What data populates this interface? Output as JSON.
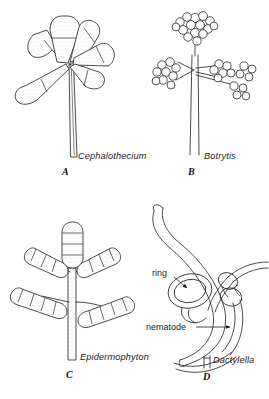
{
  "figure": {
    "background_color": "#ffffff",
    "ink_color": "#2b2b2b",
    "text_color": "#1d1d1d"
  },
  "panels": [
    {
      "id": "A",
      "letter": "A",
      "name": "Cephalothecium",
      "caption": "Cephalothecium",
      "description": "Conidiophore bearing a whorl of elongate two-celled conidia",
      "conidia_count": 6,
      "septa_per_conidium": 1
    },
    {
      "id": "B",
      "letter": "B",
      "name": "Botrytis",
      "caption": "Botrytis",
      "description": "Branched conidiophore with grape-like clusters of globose conidia",
      "cluster_count": 5
    },
    {
      "id": "C",
      "letter": "C",
      "name": "Epidermophyton",
      "caption": "Epidermophyton",
      "description": "Conidiophore with club-shaped multiseptate macroconidia",
      "macroconidia_count": 5,
      "cells_per_macroconidium": 4
    },
    {
      "id": "D",
      "letter": "D",
      "name": "Dactylella",
      "caption": "Dactylella",
      "description": "Nematode-trapping fungus with constricting rings encircling a nematode",
      "annotations": [
        {
          "label": "ring",
          "pointer": "arrow",
          "direction": "down-right"
        },
        {
          "label": "nematode",
          "pointer": "arrow",
          "direction": "right"
        }
      ]
    }
  ],
  "annotations": {
    "ring_label": "ring",
    "nematode_label": "nematode"
  },
  "captions": {
    "a": "Cephalothecium",
    "b": "Botrytis",
    "c": "Epidermophyton",
    "d": "Dactylella"
  },
  "letters": {
    "a": "A",
    "b": "B",
    "c": "C",
    "d": "D"
  }
}
